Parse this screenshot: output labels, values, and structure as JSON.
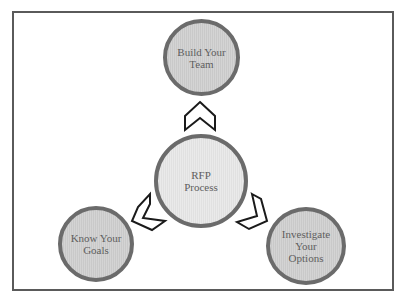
{
  "diagram": {
    "type": "cycle",
    "center": {
      "lines": [
        "RFP",
        "Process"
      ]
    },
    "nodes": [
      {
        "id": "top",
        "lines": [
          "Build Your",
          "Team"
        ]
      },
      {
        "id": "left",
        "lines": [
          "Know Your",
          "Goals"
        ]
      },
      {
        "id": "right",
        "lines": [
          "Investigate",
          "Your",
          "Options"
        ]
      }
    ],
    "connectors": [
      {
        "from": "center",
        "to": "top",
        "shape": "chevron-up"
      },
      {
        "from": "left",
        "to": "center",
        "shape": "chevron-left"
      },
      {
        "from": "center",
        "to": "right",
        "shape": "chevron-right"
      }
    ],
    "colors": {
      "frame_border": "#5a5a5a",
      "node_border": "#6b6b6b",
      "node_fill": "#cfcfcf",
      "center_fill": "#e8e8e8",
      "text": "#5e5e5e",
      "chevron_stroke": "#1a1a1a"
    }
  }
}
